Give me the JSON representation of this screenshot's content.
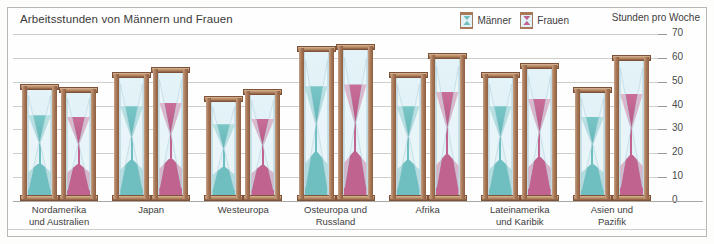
{
  "chart_title": "Arbeitsstunden von Männern und Frauen",
  "axis_caption": "Stunden pro Woche",
  "legend": [
    {
      "label": "Männer",
      "icon": "hourglass-icon",
      "color": "#6fbec0"
    },
    {
      "label": "Frauen",
      "icon": "hourglass-icon",
      "color": "#c0638f"
    }
  ],
  "colors": {
    "male": "#6fbec0",
    "female": "#c0638f",
    "frame_wood": "#a87858",
    "glass": "#e0f1f6",
    "grid": "#cfcfc9",
    "text": "#3d3d3d"
  },
  "chart_data": {
    "type": "bar",
    "title": "Arbeitsstunden von Männern und Frauen",
    "xlabel": "",
    "ylabel": "Stunden pro Woche",
    "ylim": [
      0,
      70
    ],
    "yticks": [
      0,
      10,
      20,
      30,
      40,
      50,
      60,
      70
    ],
    "grid": true,
    "legend_position": "top-right",
    "categories": [
      "Nordamerika\nund Australien",
      "Japan",
      "Westeuropa",
      "Osteuropa und\nRussland",
      "Afrika",
      "Lateinamerika\nund Karibik",
      "Asien und\nPazifik"
    ],
    "series": [
      {
        "name": "Männer",
        "color": "#6fbec0",
        "values": [
          49,
          54,
          44,
          65,
          54,
          54,
          48
        ]
      },
      {
        "name": "Frauen",
        "color": "#c0638f",
        "values": [
          48,
          56,
          47,
          66,
          62,
          58,
          61
        ]
      }
    ]
  }
}
